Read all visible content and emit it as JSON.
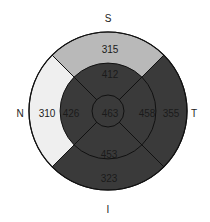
{
  "diagram": {
    "type": "ETDRS retinal thickness map",
    "directions": {
      "superior": "S",
      "inferior": "I",
      "nasal": "N",
      "temporal": "T"
    },
    "center": {
      "value": "463",
      "color": "#3a3a3a"
    },
    "inner_ring": {
      "superior": {
        "value": "412",
        "color": "#3a3a3a"
      },
      "temporal": {
        "value": "458",
        "color": "#3a3a3a"
      },
      "inferior": {
        "value": "453",
        "color": "#3a3a3a"
      },
      "nasal": {
        "value": "426",
        "color": "#3a3a3a"
      }
    },
    "outer_ring": {
      "superior": {
        "value": "315",
        "color": "#b9b9b9"
      },
      "temporal": {
        "value": "355",
        "color": "#3a3a3a"
      },
      "inferior": {
        "value": "323",
        "color": "#3a3a3a"
      },
      "nasal": {
        "value": "310",
        "color": "#efefef"
      }
    }
  }
}
